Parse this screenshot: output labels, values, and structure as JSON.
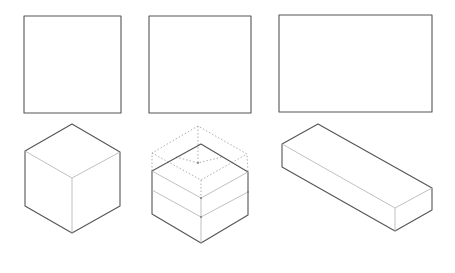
{
  "diagram": {
    "title": "",
    "colors": {
      "line": "#555555",
      "hidden_line": "#b0b0b0",
      "construction_line": "#999999",
      "background": "#ffffff"
    },
    "top_row": [
      {
        "id": "square-1",
        "shape": "square"
      },
      {
        "id": "square-2",
        "shape": "square"
      },
      {
        "id": "rectangle-3",
        "shape": "rectangle"
      }
    ],
    "bottom_row": [
      {
        "id": "cube-1",
        "shape": "isometric-cube"
      },
      {
        "id": "cube-2",
        "shape": "isometric-cube-with-construction-lines"
      },
      {
        "id": "box-3",
        "shape": "isometric-rectangular-prism"
      }
    ]
  }
}
